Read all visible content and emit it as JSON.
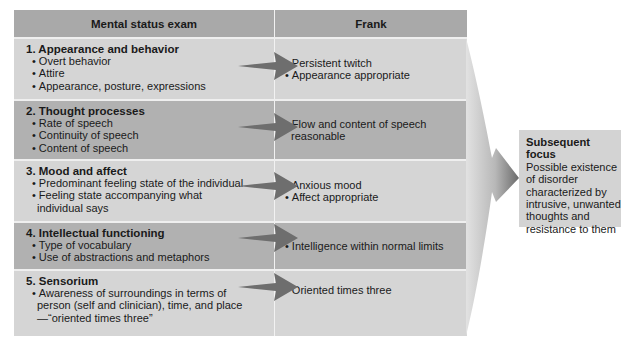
{
  "headers": {
    "left": "Mental status exam",
    "right": "Frank"
  },
  "rows": [
    {
      "title": "1. Appearance and behavior",
      "items": [
        "Overt behavior",
        "Attire",
        "Appearance, posture, expressions"
      ],
      "findings": [
        "Persistent twitch",
        "Appearance appropriate"
      ],
      "shade": "light"
    },
    {
      "title": "2. Thought processes",
      "items": [
        "Rate of speech",
        "Continuity of speech",
        "Content of speech"
      ],
      "findings": [
        "Flow and content of speech reasonable"
      ],
      "shade": "dark"
    },
    {
      "title": "3. Mood and affect",
      "items": [
        "Predominant feeling state of the individual",
        "Feeling state accompanying what individual says"
      ],
      "findings": [
        "Anxious mood",
        "Affect appropriate"
      ],
      "shade": "light"
    },
    {
      "title": "4. Intellectual functioning",
      "items": [
        "Type of vocabulary",
        "Use of abstractions and metaphors"
      ],
      "findings": [
        "Intelligence within normal limits"
      ],
      "shade": "dark"
    },
    {
      "title": "5. Sensorium",
      "items": [
        "Awareness of surroundings in terms of person (self and clinician), time, and place—“oriented times three”"
      ],
      "findings": [
        "Oriented times three"
      ],
      "shade": "light"
    }
  ],
  "focus": {
    "title": "Subsequent focus",
    "body": "Possible existence of disorder characterized by intrusive, unwanted thoughts and resistance to them"
  },
  "colors": {
    "header": "#a9a9a9",
    "light_row": "#d5d5d5",
    "dark_row": "#b1b1b1",
    "arrow": "#6e6e6e",
    "focus_box": "#d3d3d3"
  }
}
